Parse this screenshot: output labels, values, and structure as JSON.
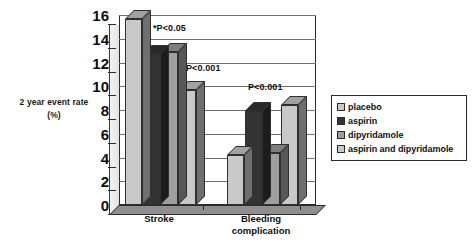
{
  "chart_data": {
    "type": "bar",
    "title": "",
    "xlabel": "",
    "ylabel": "2 year event rate",
    "ylabel_units": "(%)",
    "categories": [
      "Stroke",
      "Bleeding complication"
    ],
    "category_lines": [
      [
        "Stroke"
      ],
      [
        "Bleeding",
        "complication"
      ]
    ],
    "series": [
      {
        "name": "placebo",
        "color": "#c9c9c9",
        "values": [
          15.7,
          4.2
        ]
      },
      {
        "name": "aspirin",
        "color": "#333333",
        "values": [
          12.7,
          7.9
        ]
      },
      {
        "name": "dipyridamole",
        "color": "#9e9e9e",
        "values": [
          12.9,
          4.4
        ]
      },
      {
        "name": "aspirin and dipyridamole",
        "color": "#c9c9c9",
        "values": [
          9.7,
          8.4
        ]
      }
    ],
    "ylim": [
      0,
      16
    ],
    "ytick_step": 2,
    "yticks": [
      0,
      2,
      4,
      6,
      8,
      10,
      12,
      14,
      16
    ],
    "ytick_labels": [
      "0",
      "2",
      "4",
      "6",
      "8",
      "10",
      "12",
      "14",
      "16"
    ],
    "grid": true,
    "grid_axis": "y",
    "legend_position": "right",
    "style": "3d-bar",
    "annotations": [
      {
        "text": "*P<0.05",
        "x_px": 153,
        "y_px": 23
      },
      {
        "text": "P<0.001",
        "x_px": 186,
        "y_px": 63
      },
      {
        "text": "P<0.001",
        "x_px": 248,
        "y_px": 82
      }
    ]
  },
  "legend": {
    "items": [
      {
        "label": "placebo"
      },
      {
        "label": "aspirin"
      },
      {
        "label": "dipyridamole"
      },
      {
        "label": "aspirin and dipyridamole"
      }
    ]
  }
}
